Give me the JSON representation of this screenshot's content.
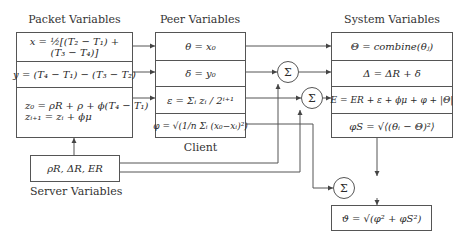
{
  "packet": {
    "title": "Packet Variables",
    "rows": [
      {
        "line1": "x = ½[(T₂ − T₁) +",
        "line2": "(T₃ − T₄)]"
      },
      {
        "line1": "y = (T₄ − T₁) − (T₃ − T₂)"
      },
      {
        "line1": "z₀ = ρR + ρ + ϕ(T₄ − T₁)",
        "line2": "zᵢ₊₁ = zᵢ + ϕμ"
      }
    ]
  },
  "server": {
    "title": "Server Variables",
    "content": "ρR, ΔR, ER"
  },
  "peer": {
    "title": "Peer Variables",
    "footer": "Client",
    "rows": [
      {
        "text": "θ = x₀"
      },
      {
        "text": "δ = y₀"
      },
      {
        "text": "ε = Σᵢ zᵢ / 2ⁱ⁺¹"
      },
      {
        "text": "φ = √(1/n Σᵢ (x₀−xᵢ)²)"
      }
    ]
  },
  "system": {
    "title": "System Variables",
    "rows": [
      {
        "text": "Θ = combine(θⱼ)"
      },
      {
        "text": "Δ = ΔR + δ"
      },
      {
        "text": "E = ER + ε + ϕμ + φ + |Θ|"
      },
      {
        "text": "φS = √⟨(θᵢ − Θ)²⟩"
      }
    ]
  },
  "sum_nodes": [
    {
      "symbol": "Σ"
    },
    {
      "symbol": "Σ"
    },
    {
      "symbol": "Σ"
    }
  ],
  "result": {
    "text": "ϑ = √(φ² + φS²)"
  }
}
